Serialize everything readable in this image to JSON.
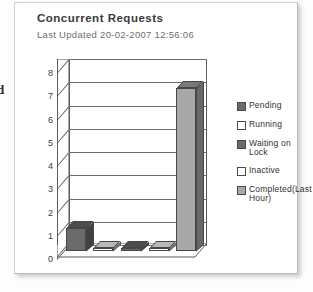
{
  "panel": {
    "title": "Concurrent Requests",
    "subtitle": "Last Updated 20-02-2007 12:56:06",
    "edge_fragment": "d"
  },
  "chart_data": {
    "type": "bar",
    "title": "Concurrent Requests",
    "subtitle": "Last Updated 20-02-2007 12:56:06",
    "xlabel": "",
    "ylabel": "",
    "ylim": [
      0,
      8
    ],
    "yticks": [
      "0",
      "1",
      "2",
      "3",
      "4",
      "5",
      "6",
      "7",
      "8"
    ],
    "grid": true,
    "legend_position": "right",
    "style": "3d-column",
    "categories": [
      "Pending",
      "Running",
      "Waiting on Lock",
      "Inactive",
      "Completed(Last Hour)"
    ],
    "values": [
      1,
      0,
      0,
      0,
      7
    ],
    "colors": [
      "#6b6b6b",
      "#ffffff",
      "#6b6b6b",
      "#ffffff",
      "#a8a8a8"
    ],
    "series": [
      {
        "name": "Concurrent Requests",
        "values": [
          1,
          0,
          0,
          0,
          7
        ]
      }
    ]
  },
  "legend": {
    "items": [
      {
        "label": "Pending",
        "color": "#6b6b6b"
      },
      {
        "label": "Running",
        "color": "#ffffff"
      },
      {
        "label": "Waiting on\nLock",
        "color": "#6b6b6b"
      },
      {
        "label": "Inactive",
        "color": "#ffffff"
      },
      {
        "label": "Completed(Last\nHour)",
        "color": "#a8a8a8"
      }
    ]
  }
}
